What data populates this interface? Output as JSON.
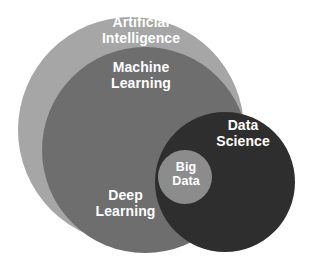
{
  "diagram": {
    "type": "venn-nested",
    "background": "#ffffff",
    "label_color": "#ffffff",
    "circles": [
      {
        "id": "artificial-intelligence",
        "label": "Artificial\nIntelligence",
        "color": "#a6a6a6",
        "cx": 131,
        "cy": 130,
        "r": 113
      },
      {
        "id": "machine-learning",
        "label": "Machine\nLearning",
        "color": "#6e6e6e",
        "cx": 145,
        "cy": 150,
        "r": 103
      },
      {
        "id": "data-science",
        "label": "Data\nScience",
        "color": "#2e2e2e",
        "cx": 225,
        "cy": 182,
        "r": 70
      },
      {
        "id": "big-data",
        "label": "Big\nData",
        "color": "#8c8c8c",
        "cx": 185,
        "cy": 177,
        "r": 27
      }
    ],
    "region_labels": [
      {
        "id": "deep-learning",
        "label": "Deep\nLearning",
        "belongs_to": "machine-learning"
      }
    ]
  }
}
